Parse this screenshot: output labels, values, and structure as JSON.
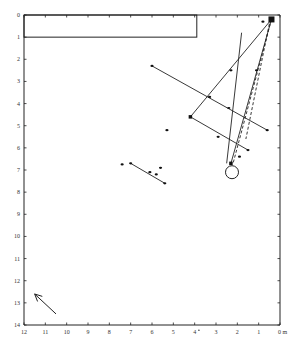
{
  "chart_data": {
    "type": "scatter",
    "title": "",
    "xlabel": "m",
    "ylabel": "",
    "x_unit_label": "0 m",
    "xlim": [
      12,
      0
    ],
    "ylim": [
      0,
      14
    ],
    "x_ticks": [
      "12",
      "11",
      "10",
      "9",
      "8",
      "7",
      "6",
      "5",
      "4",
      "3",
      "2",
      "1",
      "0 m"
    ],
    "x_tick_values": [
      12,
      11,
      10,
      9,
      8,
      7,
      6,
      5,
      4,
      3,
      2,
      1,
      0
    ],
    "y_ticks": [
      "0",
      "1",
      "2",
      "3",
      "4",
      "5",
      "6",
      "7",
      "8",
      "9",
      "10",
      "11",
      "12",
      "13",
      "14"
    ],
    "y_tick_values": [
      0,
      1,
      2,
      3,
      4,
      5,
      6,
      7,
      8,
      9,
      10,
      11,
      12,
      13,
      14
    ],
    "grid": false,
    "rectangle": {
      "x0": 12,
      "x1": 3.9,
      "y0": 0,
      "y1": 1
    },
    "solid_segments": [
      {
        "from": [
          0.4,
          0.2
        ],
        "to": [
          4.2,
          4.6
        ]
      },
      {
        "from": [
          4.2,
          4.6
        ],
        "to": [
          1.5,
          6.1
        ]
      },
      {
        "from": [
          6.0,
          2.3
        ],
        "to": [
          0.6,
          5.2
        ]
      },
      {
        "from": [
          1.8,
          0.8
        ],
        "to": [
          2.5,
          6.7
        ]
      },
      {
        "from": [
          0.4,
          0.2
        ],
        "to": [
          2.3,
          6.7
        ]
      },
      {
        "from": [
          7.0,
          6.7
        ],
        "to": [
          5.4,
          7.6
        ]
      }
    ],
    "dashed_segments": [
      {
        "from": [
          0.4,
          0.2
        ],
        "to": [
          2.2,
          6.7
        ]
      },
      {
        "from": [
          0.5,
          0.4
        ],
        "to": [
          1.6,
          5.6
        ]
      }
    ],
    "square_markers": [
      {
        "x": 0.4,
        "y": 0.2,
        "size": "large"
      },
      {
        "x": 4.2,
        "y": 4.6,
        "size": "small"
      },
      {
        "x": 2.3,
        "y": 6.7,
        "size": "small"
      }
    ],
    "circle_markers": [
      {
        "x": 2.25,
        "y": 7.1
      }
    ],
    "dot_markers": [
      {
        "x": 0.8,
        "y": 0.3
      },
      {
        "x": 1.1,
        "y": 2.5
      },
      {
        "x": 6.0,
        "y": 2.3
      },
      {
        "x": 2.3,
        "y": 2.5
      },
      {
        "x": 3.3,
        "y": 3.7
      },
      {
        "x": 2.4,
        "y": 4.2
      },
      {
        "x": 0.6,
        "y": 5.2
      },
      {
        "x": 5.3,
        "y": 5.2
      },
      {
        "x": 2.9,
        "y": 5.5
      },
      {
        "x": 1.5,
        "y": 6.1
      },
      {
        "x": 1.9,
        "y": 6.4
      },
      {
        "x": 7.4,
        "y": 6.75
      },
      {
        "x": 7.0,
        "y": 6.7
      },
      {
        "x": 6.1,
        "y": 7.1
      },
      {
        "x": 5.8,
        "y": 7.2
      },
      {
        "x": 5.4,
        "y": 7.6
      },
      {
        "x": 5.6,
        "y": 6.9
      }
    ],
    "arrow": {
      "from": [
        10.5,
        13.5
      ],
      "to": [
        11.5,
        12.6
      ]
    },
    "stray_mark": {
      "x": 3.8,
      "y": 14.1
    }
  }
}
